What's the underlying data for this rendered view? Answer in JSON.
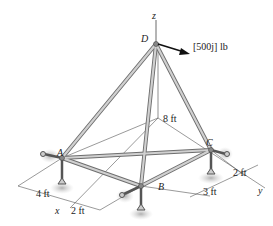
{
  "diagram": {
    "type": "space-truss",
    "joints": {
      "A": {
        "label": "A",
        "x": 62,
        "y": 158
      },
      "B": {
        "label": "B",
        "x": 141,
        "y": 186
      },
      "C": {
        "label": "C",
        "x": 211,
        "y": 150
      },
      "D": {
        "label": "D",
        "x": 156,
        "y": 42
      }
    },
    "members": [
      [
        "A",
        "D"
      ],
      [
        "B",
        "D"
      ],
      [
        "C",
        "D"
      ],
      [
        "A",
        "B"
      ],
      [
        "B",
        "C"
      ],
      [
        "A",
        "C"
      ]
    ],
    "axes": {
      "x": "x",
      "y": "y",
      "z": "z"
    },
    "load": {
      "label": "[500j] lb",
      "joint": "D"
    },
    "dimensions": {
      "height": "8 ft",
      "a_x": "4 ft",
      "b_x": "2 ft",
      "b_y": "3 ft",
      "c_y": "2 ft"
    },
    "colors": {
      "member": "#b9b9b9",
      "member_edge": "#6e6e6e",
      "support_shadow": "#bdbdbd",
      "line": "#333333"
    }
  }
}
